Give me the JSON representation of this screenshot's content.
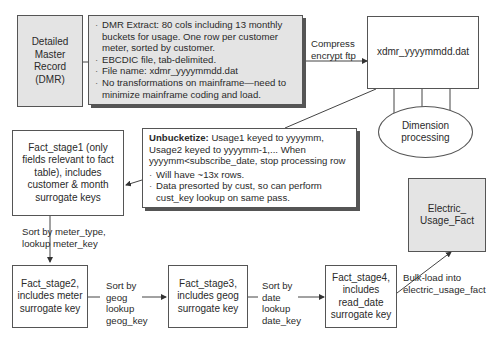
{
  "nodes": {
    "dmr": {
      "label": "Detailed Master Record (DMR)"
    },
    "dmr_extract_note": {
      "bullets": [
        "DMR Extract: 80 cols including 13 monthly buckets for usage. One row per customer meter, sorted by customer.",
        "EBCDIC file, tab-delimited.",
        "File name: xdmr_yyyymmdd.dat",
        "No transformations on mainframe—need to minimize mainframe coding and load."
      ]
    },
    "xdmr_file": {
      "label": "xdmr_yyyymmdd.dat"
    },
    "dimension_processing": {
      "label": "Dimension processing"
    },
    "unbucketize_note": {
      "title": "Unbucketize:",
      "text": " Usage1 keyed to yyyymm, Usage2 keyed to yyyymm-1,... When yyyymm<subscribe_date, stop processing row",
      "bullets": [
        "Will have ~13x rows.",
        "Data presorted by cust, so can perform cust_key lookup on same pass."
      ]
    },
    "fact_stage1": {
      "label": "Fact_stage1 (only fields relevant to fact table), includes customer & month surrogate keys"
    },
    "fact_stage2": {
      "label": "Fact_stage2, includes meter surrogate key"
    },
    "fact_stage3": {
      "label": "Fact_stage3, includes geog surrogate key"
    },
    "fact_stage4": {
      "label": "Fact_stage4, includes read_date surrogate key"
    },
    "electric_usage_fact": {
      "label": "Electric_ Usage_Fact"
    }
  },
  "edges": {
    "compress": "Compress encrypt ftp",
    "sort_meter": "Sort by meter_type, lookup meter_key",
    "sort_geog": "Sort by geog lookup geog_key",
    "sort_date": "Sort by date lookup date_key",
    "bulk_load": "Bulk-load into electric_usage_fact"
  }
}
